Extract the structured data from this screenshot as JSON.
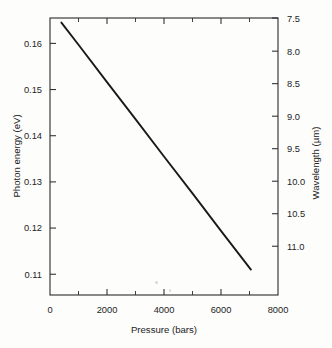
{
  "chart_data": {
    "type": "line",
    "title": "",
    "xlabel": "Pressure (bars)",
    "ylabel": "Photon energy (eV)",
    "y2label": "Wavelength (µm)",
    "xlim": [
      0,
      8000
    ],
    "ylim": [
      0.1055,
      0.1655
    ],
    "y2lim": [
      11.75,
      7.49
    ],
    "grid": false,
    "legend": null,
    "xticks": [
      0,
      2000,
      4000,
      6000,
      8000
    ],
    "xticklabels": [
      "0",
      "2000",
      "4000",
      "6000",
      "8000"
    ],
    "xminorticks": [
      1000,
      3000,
      5000,
      7000
    ],
    "yticks": [
      0.16,
      0.15,
      0.14,
      0.13,
      0.12,
      0.11
    ],
    "yticklabels": [
      "0.16",
      "0.15",
      "0.14",
      "0.13",
      "0.12",
      "0.11"
    ],
    "y2ticks": [
      7.5,
      8.0,
      8.5,
      9.0,
      9.5,
      10.0,
      10.5,
      11.0
    ],
    "y2ticklabels": [
      "7.5",
      "8.0",
      "8.5",
      "9.0",
      "9.5",
      "10.0",
      "10.5",
      "11.0"
    ],
    "series": [
      {
        "name": "Photon energy vs pressure",
        "x": [
          400,
          1000,
          2000,
          3000,
          4000,
          5000,
          6000,
          7050
        ],
        "values": [
          0.1645,
          0.1597,
          0.1516,
          0.1436,
          0.1355,
          0.1275,
          0.1194,
          0.111
        ]
      }
    ],
    "annotations": []
  },
  "axes": {
    "x_label": "Pressure (bars)",
    "y_left_label": "Photon energy (eV)",
    "y_right_label": "Wavelength (µm)"
  }
}
